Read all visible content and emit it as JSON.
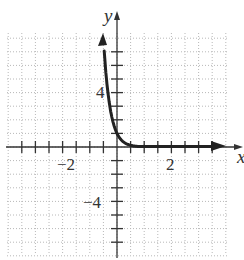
{
  "chart_data": {
    "type": "line",
    "title": "",
    "xlabel": "x",
    "ylabel": "y",
    "xlim": [
      -4,
      4
    ],
    "ylim": [
      -8,
      8
    ],
    "x_tick_step": 0.5,
    "y_tick_step": 1,
    "x_tick_labels": [
      {
        "value": -2,
        "label": "−2"
      },
      {
        "value": 2,
        "label": "2"
      }
    ],
    "y_tick_labels": [
      {
        "value": 4,
        "label": "4"
      },
      {
        "value": -4,
        "label": "−4"
      }
    ],
    "grid": true,
    "grid_style": "dotted",
    "legend": null,
    "series": [
      {
        "name": "exponential decay",
        "color": "#222222",
        "arrows": "both ends",
        "x": [
          -0.5,
          -0.4,
          -0.3,
          -0.2,
          -0.1,
          0,
          0.1,
          0.2,
          0.3,
          0.5,
          1,
          1.5,
          2,
          2.5,
          3.7
        ],
        "values": [
          8,
          5.28,
          3.48,
          2.3,
          1.52,
          1,
          0.66,
          0.44,
          0.29,
          0.13,
          0.02,
          0,
          0,
          0,
          0
        ]
      }
    ]
  },
  "axes": {
    "x_label": "x",
    "y_label": "y"
  },
  "labels": {
    "x_neg2": "−2",
    "x_pos2": "2",
    "y_pos4": "4",
    "y_neg4": "−4"
  }
}
